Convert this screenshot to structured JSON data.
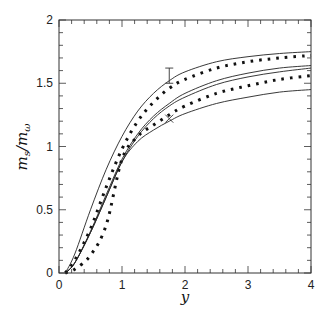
{
  "chart_data": {
    "type": "line",
    "title": "",
    "xlabel": "y",
    "ylabel": "m_s/m_ω",
    "ylabel_parts": {
      "num": "m",
      "num_sub": "s",
      "den": "m",
      "den_sub": "ω"
    },
    "xlim": [
      0,
      4
    ],
    "ylim": [
      0,
      2
    ],
    "grid": false,
    "legend": null,
    "x_ticks": [
      0,
      1,
      2,
      3,
      4
    ],
    "x_tick_labels": [
      "0",
      "1",
      "2",
      "3",
      "4"
    ],
    "y_ticks": [
      0,
      0.5,
      1,
      1.5,
      2
    ],
    "y_tick_labels": [
      "0",
      "0.5",
      "1",
      "1.5",
      "2"
    ],
    "x": [
      0.1,
      0.25,
      0.5,
      0.75,
      1.0,
      1.25,
      1.5,
      1.75,
      2.0,
      2.5,
      3.0,
      3.5,
      4.0
    ],
    "series": [
      {
        "name": "solid-upper",
        "style": "solid",
        "values": [
          0.0,
          0.15,
          0.5,
          0.82,
          1.08,
          1.28,
          1.42,
          1.52,
          1.59,
          1.67,
          1.71,
          1.735,
          1.75
        ]
      },
      {
        "name": "dotted-upper",
        "style": "dotted",
        "values": [
          0.0,
          0.1,
          0.35,
          0.68,
          0.98,
          1.2,
          1.35,
          1.46,
          1.53,
          1.62,
          1.67,
          1.7,
          1.72
        ]
      },
      {
        "name": "solid-middle-a",
        "style": "solid",
        "values": [
          0.0,
          0.08,
          0.33,
          0.62,
          0.9,
          1.1,
          1.24,
          1.34,
          1.42,
          1.52,
          1.58,
          1.62,
          1.64
        ]
      },
      {
        "name": "solid-middle-b",
        "style": "solid",
        "values": [
          0.0,
          0.08,
          0.32,
          0.6,
          0.88,
          1.08,
          1.22,
          1.32,
          1.39,
          1.49,
          1.55,
          1.59,
          1.62
        ]
      },
      {
        "name": "dotted-lower",
        "style": "dotted",
        "values": [
          0.0,
          0.03,
          0.14,
          0.38,
          0.9,
          1.08,
          1.17,
          1.25,
          1.32,
          1.42,
          1.48,
          1.53,
          1.56
        ]
      },
      {
        "name": "solid-lower",
        "style": "solid",
        "values": [
          0.0,
          0.08,
          0.32,
          0.6,
          0.88,
          1.04,
          1.13,
          1.2,
          1.26,
          1.34,
          1.39,
          1.43,
          1.45
        ]
      }
    ],
    "annotations": [
      {
        "type": "error-bar",
        "x": 1.75,
        "y_low": 1.5,
        "y_high": 1.62
      },
      {
        "type": "cross-marker",
        "x": 1.75,
        "y": 1.22
      }
    ]
  }
}
